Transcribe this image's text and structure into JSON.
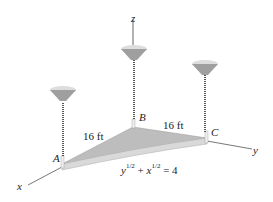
{
  "diagram": {
    "axes": {
      "x": "x",
      "y": "y",
      "z": "z"
    },
    "points": {
      "A": "A",
      "B": "B",
      "C": "C"
    },
    "dimensions": {
      "AB": "16 ft",
      "BC": "16 ft"
    },
    "equation": {
      "term1_base": "y",
      "term1_exp": "1/2",
      "op": "+",
      "term2_base": "x",
      "term2_exp": "1/2",
      "rhs": "= 4"
    },
    "colors": {
      "plate": "#b9b9b9",
      "plate_edge": "#d6d6d6",
      "cable": "#555555",
      "anchor": "#9a9a9a",
      "axis": "#555555"
    }
  }
}
